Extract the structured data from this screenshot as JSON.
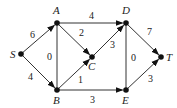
{
  "graph": {
    "type": "directed-weighted-graph",
    "nodes": [
      {
        "id": "S",
        "x": 21,
        "y": 54,
        "lx": 10,
        "ly": 58
      },
      {
        "id": "A",
        "x": 57,
        "y": 23,
        "lx": 53,
        "ly": 14
      },
      {
        "id": "B",
        "x": 57,
        "y": 90,
        "lx": 53,
        "ly": 104
      },
      {
        "id": "C",
        "x": 92,
        "y": 57,
        "lx": 88,
        "ly": 70
      },
      {
        "id": "D",
        "x": 126,
        "y": 23,
        "lx": 122,
        "ly": 14
      },
      {
        "id": "E",
        "x": 126,
        "y": 90,
        "lx": 122,
        "ly": 104
      },
      {
        "id": "T",
        "x": 161,
        "y": 57,
        "lx": 166,
        "ly": 61
      }
    ],
    "edges": [
      {
        "from": "S",
        "to": "A",
        "weight": "6",
        "directed": true,
        "wx": 30,
        "wy": 38
      },
      {
        "from": "S",
        "to": "B",
        "weight": "4",
        "directed": true,
        "wx": 28,
        "wy": 80
      },
      {
        "from": "A",
        "to": "B",
        "weight": "0",
        "directed": false,
        "wx": 47,
        "wy": 60
      },
      {
        "from": "A",
        "to": "C",
        "weight": "2",
        "directed": true,
        "wx": 79,
        "wy": 36
      },
      {
        "from": "A",
        "to": "D",
        "weight": "4",
        "directed": true,
        "wx": 89,
        "wy": 19
      },
      {
        "from": "B",
        "to": "C",
        "weight": "1",
        "directed": true,
        "wx": 78,
        "wy": 83
      },
      {
        "from": "B",
        "to": "E",
        "weight": "3",
        "directed": true,
        "wx": 90,
        "wy": 103
      },
      {
        "from": "C",
        "to": "D",
        "weight": "3",
        "directed": true,
        "wx": 110,
        "wy": 48
      },
      {
        "from": "D",
        "to": "E",
        "weight": "0",
        "directed": false,
        "wx": 131,
        "wy": 61
      },
      {
        "from": "D",
        "to": "T",
        "weight": "7",
        "directed": true,
        "wx": 147,
        "wy": 35
      },
      {
        "from": "E",
        "to": "T",
        "weight": "3",
        "directed": true,
        "wx": 148,
        "wy": 82
      }
    ]
  },
  "colors": {
    "line": "#333333",
    "node": "#111111"
  }
}
